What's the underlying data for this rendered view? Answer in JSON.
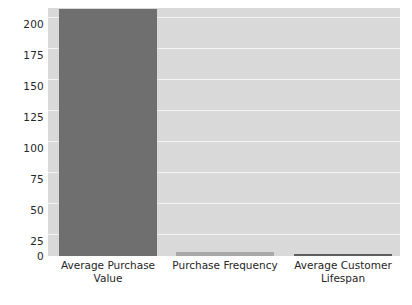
{
  "chart_data": {
    "type": "bar",
    "title": "",
    "subtitle": "",
    "xlabel": "",
    "ylabel": "Value",
    "categories": [
      "Average Purchase Value",
      "Purchase Frequency",
      "Average Customer Lifespan"
    ],
    "values": [
      199,
      3,
      1
    ],
    "ylim": [
      0,
      200
    ],
    "yticks": [
      200,
      175,
      150,
      125,
      100,
      75,
      50,
      25,
      0
    ],
    "ytick_labels": [
      "200",
      "175",
      "150",
      "125",
      "100",
      "75",
      "50",
      "25",
      "0"
    ],
    "grid": true,
    "grid_axis": "y",
    "legend": false,
    "legend_position": "none",
    "colors": {
      "bar_1": "#6f6f6f",
      "bar_2": "#a9a9a9",
      "bar_3": "#5e5e5e",
      "plot_background": "#d9d9d9",
      "figure_background": "#ffffff",
      "gridline": "#f4f4f4",
      "text": "#262626"
    }
  },
  "axis": {
    "y_title": "Value",
    "ticks": {
      "t0": "200",
      "t1": "175",
      "t2": "150",
      "t3": "125",
      "t4": "100",
      "t5": "75",
      "t6": "50",
      "t7": "25",
      "t8": "0"
    }
  },
  "categories": {
    "c0_line1": "Average Purchase",
    "c0_line2": "Value",
    "c1_line1": "Purchase Frequency",
    "c1_line2": "",
    "c2_line1": "Average Customer",
    "c2_line2": "Lifespan"
  }
}
